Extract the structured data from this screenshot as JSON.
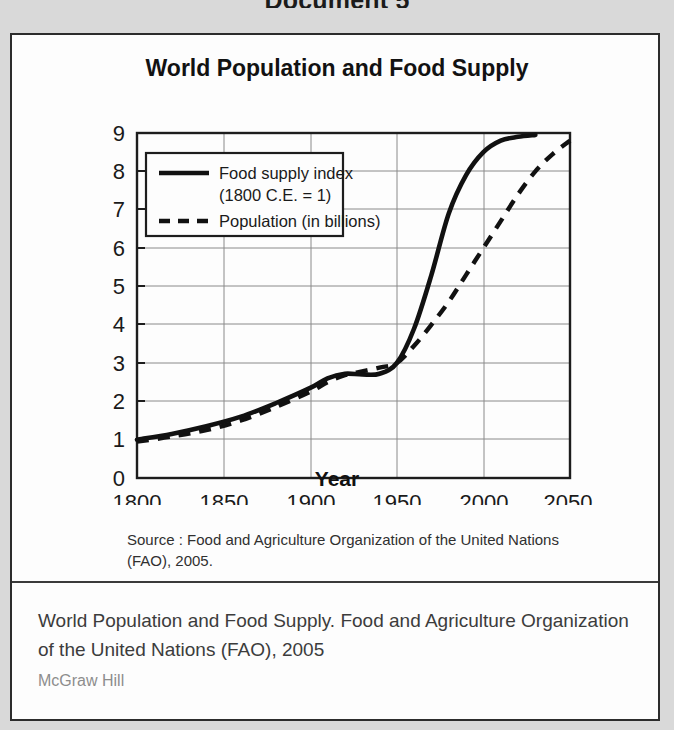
{
  "page": {
    "heading": "Document 5",
    "background_color": "#d9d9d9",
    "box_color": "#fdfdfd"
  },
  "figure": {
    "title": "World Population and Food Supply",
    "source_note": "Source : Food and Agriculture Organization of the United Nations (FAO), 2005."
  },
  "caption": {
    "text": "World Population and Food Supply. Food and Agriculture Organization of the United Nations (FAO), 2005",
    "credit": "McGraw Hill"
  },
  "chart_data": {
    "type": "line",
    "title": "World Population and Food Supply",
    "xlabel": "Year",
    "ylabel": "",
    "xlim": [
      1800,
      2050
    ],
    "ylim": [
      0,
      9
    ],
    "xticks": [
      1800,
      1850,
      1900,
      1950,
      2000,
      2050
    ],
    "yticks": [
      0,
      1,
      2,
      3,
      4,
      5,
      6,
      7,
      8,
      9
    ],
    "grid": true,
    "legend_position": "upper-left",
    "line_color": "#111111",
    "series": [
      {
        "name": "Food supply index (1800 C.E. = 1)",
        "style": "solid",
        "x": [
          1800,
          1820,
          1840,
          1860,
          1880,
          1900,
          1910,
          1920,
          1930,
          1940,
          1950,
          1960,
          1970,
          1980,
          1990,
          2000,
          2010,
          2020,
          2030
        ],
        "values": [
          1.0,
          1.15,
          1.35,
          1.6,
          1.95,
          2.35,
          2.6,
          2.72,
          2.7,
          2.72,
          3.0,
          3.9,
          5.3,
          6.9,
          7.9,
          8.5,
          8.8,
          8.9,
          8.95
        ]
      },
      {
        "name": "Population (in billions)",
        "style": "dashed",
        "x": [
          1800,
          1820,
          1840,
          1860,
          1880,
          1900,
          1910,
          1920,
          1930,
          1940,
          1950,
          1960,
          1970,
          1980,
          1990,
          2000,
          2010,
          2020,
          2030,
          2040,
          2050
        ],
        "values": [
          0.95,
          1.08,
          1.25,
          1.5,
          1.85,
          2.25,
          2.5,
          2.68,
          2.78,
          2.88,
          3.0,
          3.45,
          4.0,
          4.6,
          5.3,
          6.0,
          6.7,
          7.4,
          8.0,
          8.45,
          8.8
        ]
      }
    ],
    "legend": [
      {
        "label_line1": "Food supply index",
        "label_line2": "(1800 C.E. = 1)",
        "style": "solid"
      },
      {
        "label_line1": "Population (in billions)",
        "label_line2": "",
        "style": "dashed"
      }
    ]
  }
}
